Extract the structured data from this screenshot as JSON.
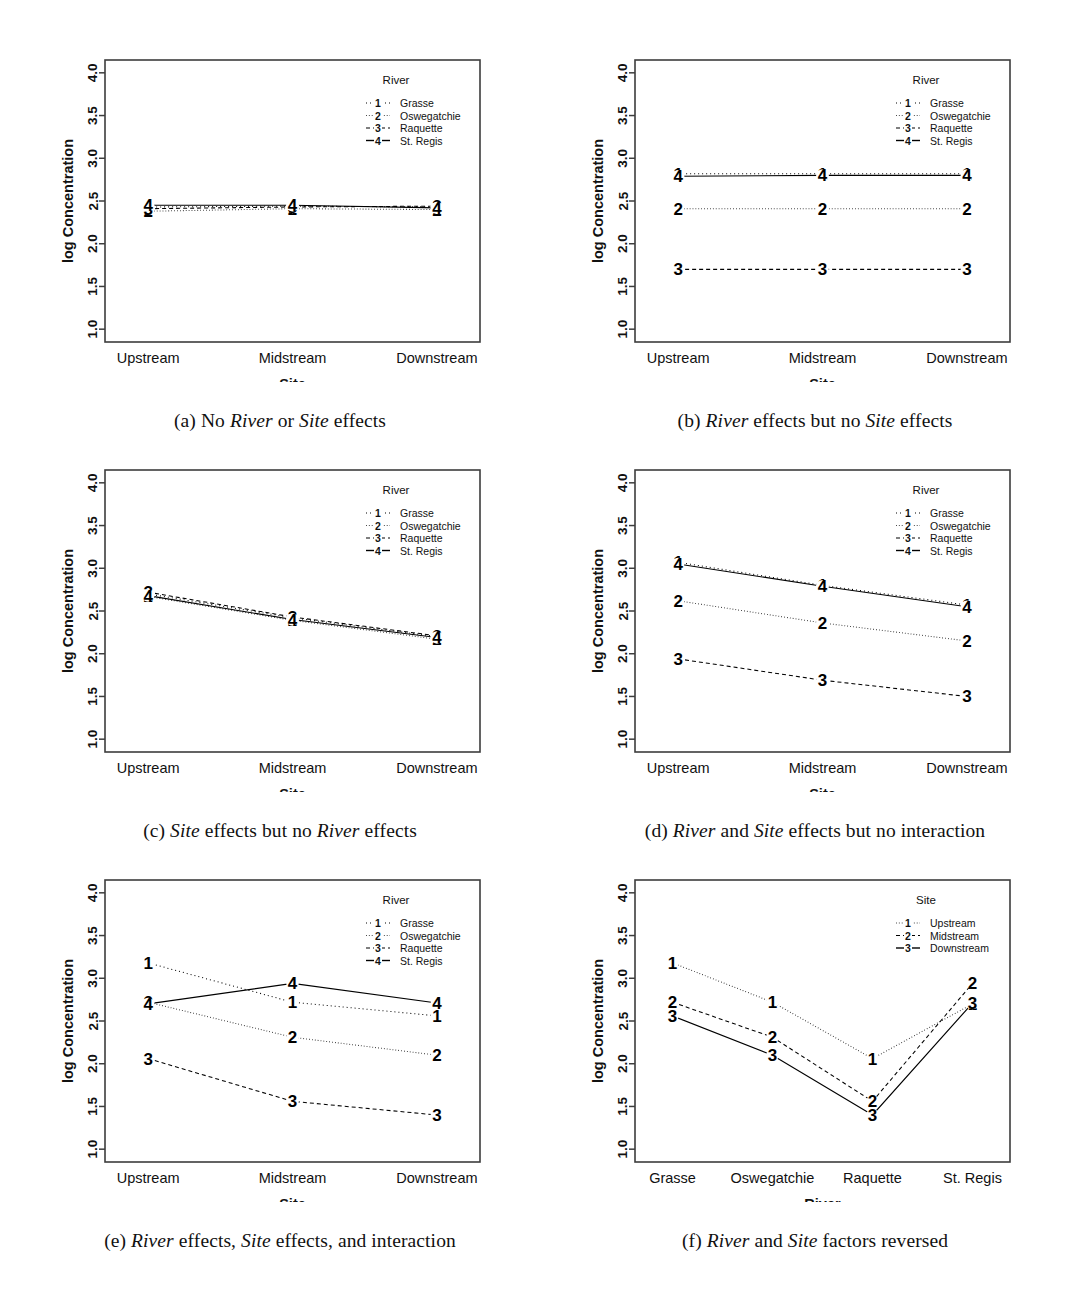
{
  "figure": {
    "width": 1073,
    "height": 1292,
    "background": "#ffffff",
    "ink": "#000000",
    "axis_color": "#3d3d3d"
  },
  "axes_common": {
    "ylabel": "log Concentration",
    "yticks": [
      "1.0",
      "1.5",
      "2.0",
      "2.5",
      "3.0",
      "3.5",
      "4.0"
    ],
    "ylim": [
      0.85,
      4.15
    ]
  },
  "legend_river": {
    "title": "River",
    "entries": [
      {
        "key": "1",
        "label": "Grasse",
        "dash": "1 3"
      },
      {
        "key": "2",
        "label": "Oswegatchie",
        "dash": "0.7 2.2"
      },
      {
        "key": "3",
        "label": "Raquette",
        "dash": "4 3"
      },
      {
        "key": "4",
        "label": "St. Regis",
        "dash": "none"
      }
    ]
  },
  "legend_site": {
    "title": "Site",
    "entries": [
      {
        "key": "1",
        "label": "Upstream",
        "dash": "0.7 2.2"
      },
      {
        "key": "2",
        "label": "Midstream",
        "dash": "4 3"
      },
      {
        "key": "3",
        "label": "Downstream",
        "dash": "none"
      }
    ]
  },
  "panels": [
    {
      "id": "a",
      "caption_prefix": "(a)",
      "caption_parts": [
        "No ",
        "River",
        " or ",
        "Site",
        " effects"
      ],
      "caption_plain": "(a) No River or Site effects",
      "legend": "river",
      "chart_data": {
        "type": "line",
        "title": "",
        "xlabel": "Site",
        "ylabel": "log Concentration",
        "categories": [
          "Upstream",
          "Midstream",
          "Downstream"
        ],
        "ylim": [
          0.85,
          4.15
        ],
        "yticks": [
          1.0,
          1.5,
          2.0,
          2.5,
          3.0,
          3.5,
          4.0
        ],
        "grid": false,
        "legend_position": "top-right-inside",
        "series": [
          {
            "name": "Grasse",
            "key": "1",
            "dash": "1 3",
            "values": [
              2.43,
              2.44,
              2.43
            ]
          },
          {
            "name": "Oswegatchie",
            "key": "2",
            "dash": "0.7 2.2",
            "values": [
              2.38,
              2.41,
              2.4
            ]
          },
          {
            "name": "Raquette",
            "key": "3",
            "dash": "4 3",
            "values": [
              2.41,
              2.43,
              2.44
            ]
          },
          {
            "name": "St. Regis",
            "key": "4",
            "dash": "none",
            "values": [
              2.45,
              2.45,
              2.42
            ]
          }
        ]
      }
    },
    {
      "id": "b",
      "caption_prefix": "(b)",
      "caption_parts": [
        "",
        "River",
        " effects but no ",
        "Site",
        " effects"
      ],
      "caption_plain": "(b) River effects but no Site effects",
      "legend": "river",
      "chart_data": {
        "type": "line",
        "title": "",
        "xlabel": "Site",
        "ylabel": "log Concentration",
        "categories": [
          "Upstream",
          "Midstream",
          "Downstream"
        ],
        "ylim": [
          0.85,
          4.15
        ],
        "yticks": [
          1.0,
          1.5,
          2.0,
          2.5,
          3.0,
          3.5,
          4.0
        ],
        "grid": false,
        "legend_position": "top-right-inside",
        "series": [
          {
            "name": "Grasse",
            "key": "1",
            "dash": "1 3",
            "values": [
              2.82,
              2.82,
              2.82
            ]
          },
          {
            "name": "Oswegatchie",
            "key": "2",
            "dash": "0.7 2.2",
            "values": [
              2.41,
              2.41,
              2.41
            ]
          },
          {
            "name": "Raquette",
            "key": "3",
            "dash": "4 3",
            "values": [
              1.7,
              1.7,
              1.7
            ]
          },
          {
            "name": "St. Regis",
            "key": "4",
            "dash": "none",
            "values": [
              2.79,
              2.8,
              2.8
            ]
          }
        ]
      }
    },
    {
      "id": "c",
      "caption_prefix": "(c)",
      "caption_parts": [
        "",
        "Site",
        " effects but no ",
        "River",
        " effects"
      ],
      "caption_plain": "(c) Site effects but no River effects",
      "legend": "river",
      "chart_data": {
        "type": "line",
        "title": "",
        "xlabel": "Site",
        "ylabel": "log Concentration",
        "categories": [
          "Upstream",
          "Midstream",
          "Downstream"
        ],
        "ylim": [
          0.85,
          4.15
        ],
        "yticks": [
          1.0,
          1.5,
          2.0,
          2.5,
          3.0,
          3.5,
          4.0
        ],
        "grid": false,
        "legend_position": "top-right-inside",
        "series": [
          {
            "name": "Grasse",
            "key": "1",
            "dash": "1 3",
            "values": [
              2.7,
              2.42,
              2.2
            ]
          },
          {
            "name": "Oswegatchie",
            "key": "2",
            "dash": "0.7 2.2",
            "values": [
              2.67,
              2.39,
              2.17
            ]
          },
          {
            "name": "Raquette",
            "key": "3",
            "dash": "4 3",
            "values": [
              2.72,
              2.43,
              2.21
            ]
          },
          {
            "name": "St. Regis",
            "key": "4",
            "dash": "none",
            "values": [
              2.68,
              2.4,
              2.19
            ]
          }
        ]
      }
    },
    {
      "id": "d",
      "caption_prefix": "(d)",
      "caption_parts": [
        "",
        "River",
        " and ",
        "Site",
        " effects but no interaction"
      ],
      "caption_plain": "(d) River and Site effects but no interaction",
      "legend": "river",
      "chart_data": {
        "type": "line",
        "title": "",
        "xlabel": "Site",
        "ylabel": "log Concentration",
        "categories": [
          "Upstream",
          "Midstream",
          "Downstream"
        ],
        "ylim": [
          0.85,
          4.15
        ],
        "yticks": [
          1.0,
          1.5,
          2.0,
          2.5,
          3.0,
          3.5,
          4.0
        ],
        "grid": false,
        "legend_position": "top-right-inside",
        "series": [
          {
            "name": "Grasse",
            "key": "1",
            "dash": "1 3",
            "values": [
              3.07,
              2.8,
              2.57
            ]
          },
          {
            "name": "Oswegatchie",
            "key": "2",
            "dash": "0.7 2.2",
            "values": [
              2.62,
              2.36,
              2.15
            ]
          },
          {
            "name": "Raquette",
            "key": "3",
            "dash": "4 3",
            "values": [
              1.94,
              1.69,
              1.5
            ]
          },
          {
            "name": "St. Regis",
            "key": "4",
            "dash": "none",
            "values": [
              3.05,
              2.79,
              2.55
            ]
          }
        ]
      }
    },
    {
      "id": "e",
      "caption_prefix": "(e)",
      "caption_parts": [
        "",
        "River",
        " effects, ",
        "Site",
        " effects, and interaction"
      ],
      "caption_plain": "(e) River effects, Site effects, and interaction",
      "legend": "river",
      "chart_data": {
        "type": "line",
        "title": "",
        "xlabel": "Site",
        "ylabel": "log Concentration",
        "categories": [
          "Upstream",
          "Midstream",
          "Downstream"
        ],
        "ylim": [
          0.85,
          4.15
        ],
        "yticks": [
          1.0,
          1.5,
          2.0,
          2.5,
          3.0,
          3.5,
          4.0
        ],
        "grid": false,
        "legend_position": "top-right-inside",
        "series": [
          {
            "name": "Grasse",
            "key": "1",
            "dash": "1 3",
            "values": [
              3.18,
              2.72,
              2.56
            ]
          },
          {
            "name": "Oswegatchie",
            "key": "2",
            "dash": "0.7 2.2",
            "values": [
              2.72,
              2.31,
              2.1
            ]
          },
          {
            "name": "Raquette",
            "key": "3",
            "dash": "4 3",
            "values": [
              2.06,
              1.56,
              1.4
            ]
          },
          {
            "name": "St. Regis",
            "key": "4",
            "dash": "none",
            "values": [
              2.7,
              2.94,
              2.71
            ]
          }
        ]
      }
    },
    {
      "id": "f",
      "caption_prefix": "(f)",
      "caption_parts": [
        "",
        "River",
        " and ",
        "Site",
        " factors reversed"
      ],
      "caption_plain": "(f) River and Site factors reversed",
      "legend": "site",
      "chart_data": {
        "type": "line",
        "title": "",
        "xlabel": "River",
        "ylabel": "log Concentration",
        "categories": [
          "Grasse",
          "Oswegatchie",
          "Raquette",
          "St. Regis"
        ],
        "ylim": [
          0.85,
          4.15
        ],
        "yticks": [
          1.0,
          1.5,
          2.0,
          2.5,
          3.0,
          3.5,
          4.0
        ],
        "grid": false,
        "legend_position": "top-right-inside",
        "series": [
          {
            "name": "Upstream",
            "key": "1",
            "dash": "0.7 2.2",
            "values": [
              3.18,
              2.72,
              2.06,
              2.7
            ]
          },
          {
            "name": "Midstream",
            "key": "2",
            "dash": "4 3",
            "values": [
              2.72,
              2.31,
              1.56,
              2.94
            ]
          },
          {
            "name": "Downstream",
            "key": "3",
            "dash": "none",
            "values": [
              2.56,
              2.1,
              1.4,
              2.71
            ]
          }
        ]
      }
    }
  ]
}
